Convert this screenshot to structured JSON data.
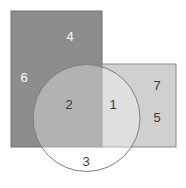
{
  "diagram": {
    "type": "venn-region-diagram",
    "canvas": {
      "width": 186,
      "height": 188,
      "background": "#ffffff"
    },
    "shapes": [
      {
        "id": "rect-a",
        "name": "dark-rectangle",
        "kind": "rect",
        "x": 11,
        "y": 11,
        "width": 91,
        "height": 136,
        "fill": "#8d8d8d",
        "stroke": "#6e6e6e"
      },
      {
        "id": "rect-b",
        "name": "light-rectangle",
        "kind": "rect",
        "x": 102,
        "y": 64,
        "width": 74,
        "height": 83,
        "fill": "#d0d0d0",
        "stroke": "#8b8b8b"
      },
      {
        "id": "circle-c",
        "name": "circle",
        "kind": "circle",
        "cx": 86.5,
        "cy": 118,
        "r": 53.5,
        "fill": "#ffffff",
        "fill_opacity": 0.33,
        "stroke": "#7d7d7d"
      }
    ],
    "regions": [
      {
        "id": "region-1",
        "label": "1",
        "x": 113,
        "y": 106,
        "color": "#9b9b9b",
        "description": "circle intersect light-rectangle"
      },
      {
        "id": "region-2",
        "label": "2",
        "x": 69,
        "y": 106,
        "color": "#a7a7a7",
        "description": "circle intersect dark-rectangle"
      },
      {
        "id": "region-3",
        "label": "3",
        "x": 86,
        "y": 163,
        "color": "#d4d4d4",
        "description": "circle only"
      },
      {
        "id": "region-4",
        "label": "4",
        "x": 70,
        "y": 38,
        "color": "#ffffff",
        "description": "dark-rectangle only, upper"
      },
      {
        "id": "region-5",
        "label": "5",
        "x": 157,
        "y": 119,
        "color": "#3a3a3a",
        "description": "light-rectangle only, lower"
      },
      {
        "id": "region-6",
        "label": "6",
        "x": 24,
        "y": 79,
        "color": "#ffffff",
        "description": "dark-rectangle only, left"
      },
      {
        "id": "region-7",
        "label": "7",
        "x": 157,
        "y": 87,
        "color": "#3a3a3a",
        "description": "light-rectangle only, upper"
      }
    ],
    "label_colors": {
      "on_dark": "#ffffff",
      "on_light": "#3a3a3a"
    }
  }
}
